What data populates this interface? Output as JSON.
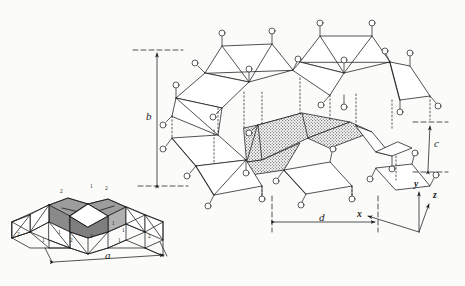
{
  "figure": {
    "type": "crystal-structure-diagram",
    "background_color": "#fbfbfa",
    "line_color": "#1a1a1a",
    "shaded_fill": "#b9b9b9",
    "stipple_fill": "#cfcfcf"
  },
  "dimensions": {
    "b": "b",
    "c": "c",
    "d": "d",
    "a": "a"
  },
  "axes": {
    "x": "x",
    "y": "y",
    "z": "z"
  },
  "tetrahedra_labels": {
    "upper_left": "2",
    "upper_center": "1",
    "upper_right": "2",
    "mid_left": "1",
    "mid_center_left": "1",
    "mid_center_right": "1",
    "mid_right": "1",
    "low_far_left": "2",
    "low_left": "1",
    "low_center": "2",
    "low_center_right": "2",
    "low_right": "1",
    "low_far_right": "2"
  },
  "small_diagram": {
    "caption_dim": "a",
    "numbers": [
      "2",
      "1",
      "2",
      "1",
      "1",
      "1",
      "1",
      "2",
      "1",
      "2",
      "2",
      "1",
      "2"
    ]
  },
  "main_diagram": {
    "dim_b": "b",
    "dim_c": "c",
    "dim_d": "d"
  }
}
